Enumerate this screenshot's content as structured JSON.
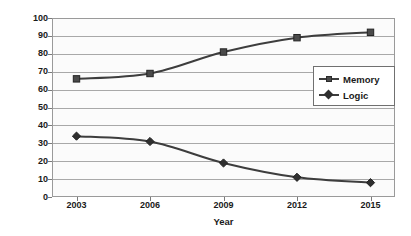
{
  "chart_data": {
    "type": "line",
    "title": "",
    "xlabel": "Year",
    "ylabel": "Area contribution, %",
    "categories": [
      "2003",
      "2006",
      "2009",
      "2012",
      "2015"
    ],
    "x": [
      2003,
      2006,
      2009,
      2012,
      2015
    ],
    "xlim": [
      2002,
      2016
    ],
    "ylim": [
      0,
      100
    ],
    "ytick_step": 10,
    "yticks": [
      "0",
      "10",
      "20",
      "30",
      "40",
      "50",
      "60",
      "70",
      "80",
      "90",
      "100"
    ],
    "grid": "horizontal",
    "legend_position": "inside-right",
    "series": [
      {
        "name": "Memory",
        "marker": "square",
        "color": "#3d3d3d",
        "values": [
          66,
          69,
          81,
          89,
          92
        ]
      },
      {
        "name": "Logic",
        "marker": "diamond",
        "color": "#3d3d3d",
        "values": [
          34,
          31,
          19,
          11,
          8
        ]
      }
    ]
  },
  "legend": {
    "entries": [
      {
        "label": "Memory",
        "marker": "square"
      },
      {
        "label": "Logic",
        "marker": "diamond"
      }
    ]
  },
  "colors": {
    "line": "#3d3d3d",
    "grid": "#a8a8a8",
    "frame": "#9a9a9a",
    "plot_background": "#fbfbfb",
    "page_background": "#ffffff",
    "text": "#1a1a1a"
  }
}
